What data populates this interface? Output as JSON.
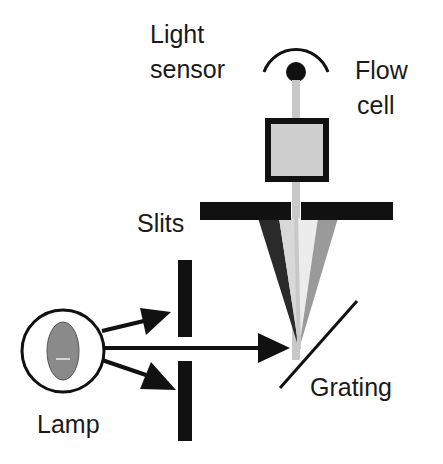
{
  "diagram": {
    "labels": {
      "light_sensor_line1": "Light",
      "light_sensor_line2": "sensor",
      "flow_cell_line1": "Flow",
      "flow_cell_line2": "cell",
      "slits": "Slits",
      "grating": "Grating",
      "lamp": "Lamp"
    },
    "colors": {
      "ink": "#111111",
      "beam": "#c8c8c8",
      "flow_cell_fill": "#cfcfcf",
      "lamp_bulb": "#8a8a8a",
      "spectrum_dark": "#2a2a2a",
      "spectrum_light": "#d8d8d8",
      "spectrum_lighter": "#ececec",
      "spectrum_mid": "#9a9a9a"
    },
    "components": [
      {
        "name": "light-sensor",
        "label_ref": "light_sensor"
      },
      {
        "name": "flow-cell",
        "label_ref": "flow_cell"
      },
      {
        "name": "exit-slit",
        "label_ref": "slits"
      },
      {
        "name": "entrance-slits",
        "label_ref": "slits"
      },
      {
        "name": "grating",
        "label_ref": "grating"
      },
      {
        "name": "lamp",
        "label_ref": "lamp"
      }
    ]
  }
}
